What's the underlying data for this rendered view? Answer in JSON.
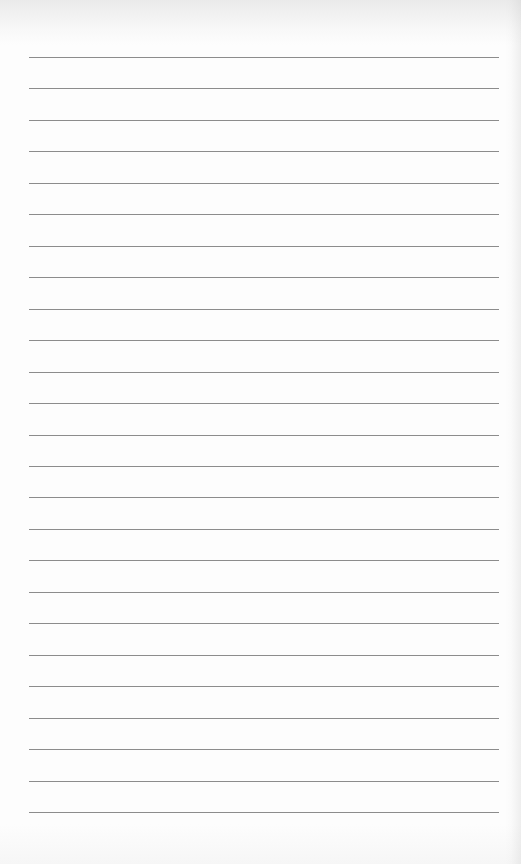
{
  "page": {
    "type": "lined-paper",
    "background_color": "#fdfdfd",
    "line_color": "#8c8c8c",
    "line_count": 25,
    "first_line_y": 57,
    "line_spacing": 31.46,
    "line_left": 29,
    "line_width": 470
  }
}
